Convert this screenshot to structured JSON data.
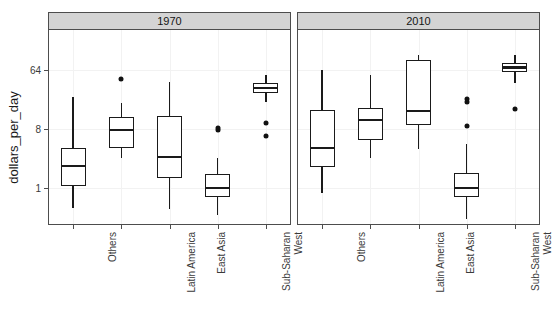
{
  "chart_data": {
    "type": "box",
    "title": "",
    "xlabel": "",
    "ylabel": "dollars_per_day",
    "y_scale": "log2",
    "y_ticks": [
      1,
      8,
      64
    ],
    "y_tick_labels": [
      "1",
      "8",
      "64"
    ],
    "ylim": [
      0.3,
      128
    ],
    "grid": true,
    "facet_labels": [
      "1970",
      "2010"
    ],
    "categories": [
      "Others",
      "Latin America",
      "East Asia",
      "Sub-Saharan",
      "West"
    ],
    "panels": [
      {
        "facet": "1970",
        "boxes": [
          {
            "category": "Others",
            "whisker_low": 0.49,
            "q1": 1.07,
            "median": 2.2,
            "q3": 4.1,
            "whisker_high": 24.8,
            "outliers": []
          },
          {
            "category": "Latin America",
            "whisker_low": 2.9,
            "q1": 4.1,
            "median": 7.7,
            "q3": 12.2,
            "whisker_high": 20.0,
            "outliers": [
              46
            ]
          },
          {
            "category": "East Asia",
            "whisker_low": 0.47,
            "q1": 1.4,
            "median": 3.0,
            "q3": 12.6,
            "whisker_high": 42.0,
            "outliers": []
          },
          {
            "category": "Sub-Saharan",
            "whisker_low": 0.39,
            "q1": 0.72,
            "median": 1.0,
            "q3": 1.65,
            "whisker_high": 2.9,
            "outliers": [
              7.6,
              8.2
            ]
          },
          {
            "category": "West",
            "whisker_low": 21.0,
            "q1": 28.0,
            "median": 34.0,
            "q3": 41.0,
            "whisker_high": 54.0,
            "outliers": [
              10.0,
              6.3
            ]
          }
        ]
      },
      {
        "facet": "2010",
        "boxes": [
          {
            "category": "Others",
            "whisker_low": 0.84,
            "q1": 2.1,
            "median": 4.1,
            "q3": 15.5,
            "whisker_high": 64.0,
            "outliers": []
          },
          {
            "category": "Latin America",
            "whisker_low": 2.9,
            "q1": 5.4,
            "median": 11.0,
            "q3": 17.0,
            "whisker_high": 54.0,
            "outliers": []
          },
          {
            "category": "East Asia",
            "whisker_low": 3.9,
            "q1": 9.1,
            "median": 15.0,
            "q3": 90.0,
            "whisker_high": 110.0,
            "outliers": []
          },
          {
            "category": "Sub-Saharan",
            "whisker_low": 0.34,
            "q1": 0.72,
            "median": 1.0,
            "q3": 1.7,
            "whisker_high": 4.7,
            "outliers": [
              9.0,
              21.0,
              23.0
            ]
          },
          {
            "category": "West",
            "whisker_low": 41.0,
            "q1": 60.0,
            "median": 70.0,
            "q3": 81.0,
            "whisker_high": 110.0,
            "outliers": [
              16.0
            ]
          }
        ]
      }
    ],
    "colors": {
      "box_stroke": "#1a1a1a",
      "box_fill": "#ffffff",
      "strip_fill": "#d4d4d4",
      "panel_border": "#4d4d4d",
      "grid": "#f2f2f2",
      "text": "#3a3a3a"
    }
  }
}
